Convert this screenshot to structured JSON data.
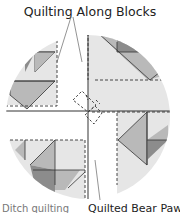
{
  "diagram": {
    "title": "Quilting Along Blocks",
    "bottom_left_label": "Ditch quilting",
    "bottom_right_label": "Quilted Bear Paw",
    "colors": {
      "light_fill": "#e6e6e6",
      "mid_fill": "#b9b9b9",
      "dark_fill": "#8c8c8c",
      "line": "#333333"
    }
  }
}
